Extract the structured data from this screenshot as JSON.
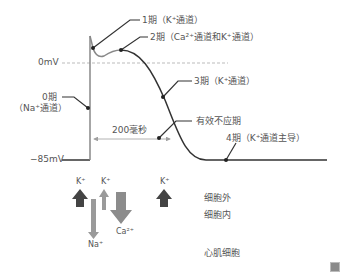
{
  "axis": {
    "zero_label": "0mV",
    "rest_label": "−85mV",
    "duration_label": "200毫秒"
  },
  "phases": [
    {
      "label": "1期（K⁺通道）"
    },
    {
      "label": "2期（Ca²⁺通道和K⁺通道）"
    },
    {
      "label": "3期（K⁺通道）"
    },
    {
      "label_line1": "0期",
      "label_line2": "（Na⁺通道）"
    },
    {
      "label": "有效不应期"
    },
    {
      "label": "4期（K⁺通道主导）"
    }
  ],
  "ions": {
    "k1": "K⁺",
    "k2": "K⁺",
    "k3": "K⁺",
    "na": "Na⁺",
    "ca": "Ca²⁺"
  },
  "regions": {
    "outside": "细胞外",
    "inside": "细胞内",
    "cell_type": "心肌细胞"
  },
  "colors": {
    "curve": "#333333",
    "axis": "#888888",
    "dashed": "#aaaaaa",
    "arrow_dark": "#444444",
    "arrow_light": "#9a9a9a",
    "arrow_ca": "#8c8c8c",
    "arrow_duration": "#999999"
  }
}
